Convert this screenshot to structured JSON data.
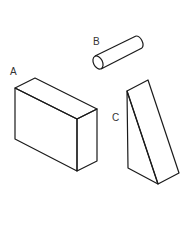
{
  "figure": {
    "labels": {
      "a": "A",
      "b": "B",
      "c": "C"
    },
    "shapes": [
      {
        "id": "A",
        "type": "rectangular-prism"
      },
      {
        "id": "B",
        "type": "cylinder"
      },
      {
        "id": "C",
        "type": "triangular-prism"
      }
    ]
  }
}
